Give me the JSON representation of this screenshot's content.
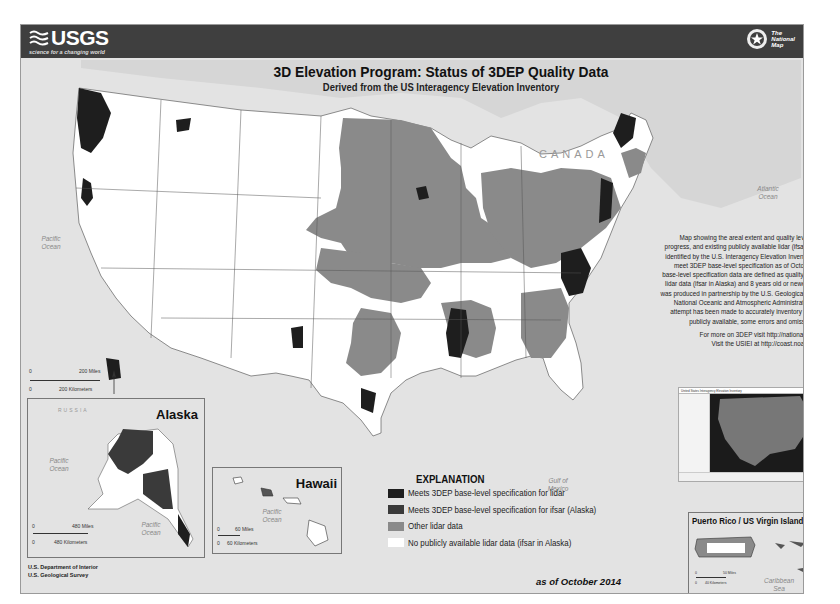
{
  "header": {
    "logo_text": "USGS",
    "tagline": "science for a changing world",
    "partner_logo": {
      "line1": "The",
      "line2": "National",
      "line3": "Map"
    }
  },
  "title": {
    "main": "3D Elevation Program: Status of 3DEP Quality Data",
    "subtitle": "Derived from the US Interagency Elevation Inventory"
  },
  "map_labels": {
    "canada": "CANADA",
    "mexico": "MEXICO",
    "pacific_ocean": "Pacific Ocean",
    "atlantic_ocean": "Atlantic Ocean",
    "gulf_of_mexico": "Gulf of Mexico"
  },
  "main_scale": {
    "zero": "0",
    "miles": "200 Miles",
    "km": "200 Kilometers"
  },
  "description": {
    "text": "Map showing the areal extent and quality level of planned, in progress, and existing publicly available lidar (ifsar in Alaska) data identified by the U.S. Interagency Elevation Inventory (USIEI) that meet 3DEP base-level specification as of October 2014. 3DEP base-level specification data are defined as quality level 2 or better lidar data (ifsar in Alaska) and 8 years old or newer. The inventory was produced in partnership by the U.S. Geological Survey and the National Oceanic and Atmospheric Administration. While every attempt has been made to accurately inventory projects that are publicly available, some errors and omissions may occur.",
    "link1": "For more on 3DEP visit http://nationalmap.gov/3DEP/",
    "link2": "Visit the USIEI at http://coast.noaa.gov/inventory/"
  },
  "thumbnail": {
    "title": "United States Interagency Elevation Inventory"
  },
  "insets": {
    "alaska": {
      "title": "Alaska",
      "russia": "RUSSIA",
      "canada": "CANADA",
      "pacific_ocean_1": "Pacific Ocean",
      "pacific_ocean_2": "Pacific Ocean",
      "scale": {
        "zero": "0",
        "miles": "480 Miles",
        "km": "480 Kilometers"
      }
    },
    "hawaii": {
      "title": "Hawaii",
      "pacific_ocean": "Pacific Ocean",
      "scale": {
        "zero": "0",
        "miles": "60 Miles",
        "km": "60 Kilometers"
      }
    },
    "puerto_rico": {
      "title": "Puerto Rico / US Virgin Islands",
      "caribbean_sea": "Caribbean Sea",
      "scale": {
        "zero": "0",
        "miles": "50 Miles",
        "km": "40 Kilometers"
      }
    }
  },
  "legend": {
    "title": "EXPLANATION",
    "items": [
      {
        "label": "Meets 3DEP base-level specification for lidar",
        "color": "#1e1e1e"
      },
      {
        "label": "Meets 3DEP base-level specification for ifsar (Alaska)",
        "color": "#3a3a3a"
      },
      {
        "label": "Other lidar data",
        "color": "#8a8a8a"
      },
      {
        "label": "No publicly available lidar data (ifsar in Alaska)",
        "color": "#ffffff"
      }
    ],
    "as_of": "as of October 2014"
  },
  "credits": {
    "line1": "U.S. Department of Interior",
    "line2": "U.S. Geological Survey"
  },
  "colors": {
    "header_bg": "#3f3f3f",
    "water": "#e3e3e3",
    "land_none": "#ffffff",
    "lidar_meets": "#1e1e1e",
    "lidar_other": "#8a8a8a"
  }
}
